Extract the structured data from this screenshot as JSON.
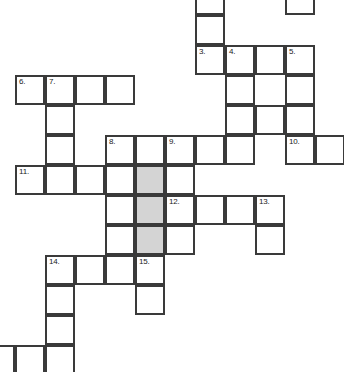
{
  "puzzle": {
    "type": "crossword-grid",
    "title": "Crossword puzzle grid",
    "cell_size": 30,
    "grid_origin": {
      "x": 15,
      "y": 15
    },
    "colors": {
      "cell_fill": "#ffffff",
      "cell_border": "#3a3a3a",
      "shaded_fill": "#d4d4d4",
      "number_text": "#1a1a1a",
      "page_background": "#ffffff"
    },
    "numbers_visible": [
      "3.",
      "4.",
      "5.",
      "6.",
      "7.",
      "8.",
      "9.",
      "10.",
      "11.",
      "12.",
      "13.",
      "14.",
      "15."
    ],
    "cells": [
      {
        "x": 195,
        "y": -15,
        "number": "",
        "shaded": false
      },
      {
        "x": 285,
        "y": -15,
        "number": "",
        "shaded": false
      },
      {
        "x": 195,
        "y": 15,
        "number": "",
        "shaded": false
      },
      {
        "x": 195,
        "y": 45,
        "number": "3.",
        "shaded": false
      },
      {
        "x": 225,
        "y": 45,
        "number": "4.",
        "shaded": false
      },
      {
        "x": 255,
        "y": 45,
        "number": "",
        "shaded": false
      },
      {
        "x": 285,
        "y": 45,
        "number": "5.",
        "shaded": false
      },
      {
        "x": 15,
        "y": 75,
        "number": "6.",
        "shaded": false
      },
      {
        "x": 45,
        "y": 75,
        "number": "7.",
        "shaded": false
      },
      {
        "x": 75,
        "y": 75,
        "number": "",
        "shaded": false
      },
      {
        "x": 105,
        "y": 75,
        "number": "",
        "shaded": false
      },
      {
        "x": 225,
        "y": 75,
        "number": "",
        "shaded": false
      },
      {
        "x": 285,
        "y": 75,
        "number": "",
        "shaded": false
      },
      {
        "x": 45,
        "y": 105,
        "number": "",
        "shaded": false
      },
      {
        "x": 225,
        "y": 105,
        "number": "",
        "shaded": false
      },
      {
        "x": 255,
        "y": 105,
        "number": "",
        "shaded": false
      },
      {
        "x": 285,
        "y": 105,
        "number": "",
        "shaded": false
      },
      {
        "x": 45,
        "y": 135,
        "number": "",
        "shaded": false
      },
      {
        "x": 105,
        "y": 135,
        "number": "8.",
        "shaded": false
      },
      {
        "x": 135,
        "y": 135,
        "number": "",
        "shaded": false
      },
      {
        "x": 165,
        "y": 135,
        "number": "9.",
        "shaded": false
      },
      {
        "x": 195,
        "y": 135,
        "number": "",
        "shaded": false
      },
      {
        "x": 225,
        "y": 135,
        "number": "",
        "shaded": false
      },
      {
        "x": 285,
        "y": 135,
        "number": "10.",
        "shaded": false
      },
      {
        "x": 315,
        "y": 135,
        "number": "",
        "shaded": false
      },
      {
        "x": 15,
        "y": 165,
        "number": "11.",
        "shaded": false
      },
      {
        "x": 45,
        "y": 165,
        "number": "",
        "shaded": false
      },
      {
        "x": 75,
        "y": 165,
        "number": "",
        "shaded": false
      },
      {
        "x": 105,
        "y": 165,
        "number": "",
        "shaded": false
      },
      {
        "x": 135,
        "y": 165,
        "number": "",
        "shaded": true
      },
      {
        "x": 165,
        "y": 165,
        "number": "",
        "shaded": false
      },
      {
        "x": 105,
        "y": 195,
        "number": "",
        "shaded": false
      },
      {
        "x": 135,
        "y": 195,
        "number": "",
        "shaded": true
      },
      {
        "x": 165,
        "y": 195,
        "number": "12.",
        "shaded": false
      },
      {
        "x": 195,
        "y": 195,
        "number": "",
        "shaded": false
      },
      {
        "x": 225,
        "y": 195,
        "number": "",
        "shaded": false
      },
      {
        "x": 255,
        "y": 195,
        "number": "13.",
        "shaded": false
      },
      {
        "x": 105,
        "y": 225,
        "number": "",
        "shaded": false
      },
      {
        "x": 135,
        "y": 225,
        "number": "",
        "shaded": true
      },
      {
        "x": 165,
        "y": 225,
        "number": "",
        "shaded": false
      },
      {
        "x": 255,
        "y": 225,
        "number": "",
        "shaded": false
      },
      {
        "x": 45,
        "y": 255,
        "number": "14.",
        "shaded": false
      },
      {
        "x": 75,
        "y": 255,
        "number": "",
        "shaded": false
      },
      {
        "x": 105,
        "y": 255,
        "number": "",
        "shaded": false
      },
      {
        "x": 135,
        "y": 255,
        "number": "15.",
        "shaded": false
      },
      {
        "x": 45,
        "y": 285,
        "number": "",
        "shaded": false
      },
      {
        "x": 135,
        "y": 285,
        "number": "",
        "shaded": false
      },
      {
        "x": 45,
        "y": 315,
        "number": "",
        "shaded": false
      },
      {
        "x": 15,
        "y": 345,
        "number": "",
        "shaded": false
      },
      {
        "x": 45,
        "y": 345,
        "number": "",
        "shaded": false
      },
      {
        "x": -15,
        "y": 345,
        "number": "",
        "shaded": false
      }
    ]
  }
}
